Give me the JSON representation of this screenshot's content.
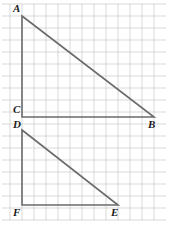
{
  "figure": {
    "canvas": {
      "width": 169,
      "height": 229
    },
    "grid": {
      "cell_size": 12,
      "x_start": 10,
      "y_start": 4,
      "x_end": 160,
      "y_end": 220,
      "color": "#c9c9c9",
      "line_width": 0.7,
      "visible": true
    },
    "shape_style": {
      "color": "#6b6b6b",
      "line_width": 1.6
    },
    "triangles": [
      {
        "name": "triangle-abc",
        "vertices": [
          {
            "label": "A",
            "x": 22,
            "y": 16
          },
          {
            "label": "B",
            "x": 154,
            "y": 117
          },
          {
            "label": "C",
            "x": 22,
            "y": 117
          }
        ],
        "legs": {
          "vertical": 101,
          "horizontal": 132
        },
        "right_angle_at": "C"
      },
      {
        "name": "triangle-def",
        "vertices": [
          {
            "label": "D",
            "x": 22,
            "y": 130
          },
          {
            "label": "E",
            "x": 118,
            "y": 205
          },
          {
            "label": "F",
            "x": 22,
            "y": 205
          }
        ],
        "legs": {
          "vertical": 75,
          "horizontal": 96
        },
        "right_angle_at": "F"
      }
    ],
    "labels": [
      {
        "name": "vertex-label-a",
        "text": "A",
        "left": 13,
        "top": 3
      },
      {
        "name": "vertex-label-b",
        "text": "B",
        "left": 148,
        "top": 119
      },
      {
        "name": "vertex-label-c",
        "text": "C",
        "left": 13,
        "top": 104
      },
      {
        "name": "vertex-label-d",
        "text": "D",
        "left": 13,
        "top": 119
      },
      {
        "name": "vertex-label-e",
        "text": "E",
        "left": 111,
        "top": 207
      },
      {
        "name": "vertex-label-f",
        "text": "F",
        "left": 13,
        "top": 207
      }
    ]
  }
}
